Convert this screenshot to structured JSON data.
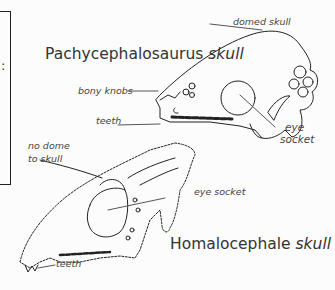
{
  "diagram": {
    "skulls": [
      {
        "id": "pachycephalosaurus",
        "genus": "Pachycephalosaurus",
        "suffix": "skull",
        "labels": {
          "domed_skull": "domed skull",
          "bony_knobs": "bony knobs",
          "teeth": "teeth",
          "eye_socket_line1": "eye",
          "eye_socket_line2": "socket"
        }
      },
      {
        "id": "homalocephale",
        "genus": "Homalocephale",
        "suffix": "skull",
        "labels": {
          "no_dome_line1": "no dome",
          "no_dome_line2": "to skull",
          "eye_socket": "eye socket",
          "teeth": "teeth"
        }
      }
    ],
    "side_box_fragment": ":"
  },
  "colors": {
    "background": "#fcfcfc",
    "line": "#222222",
    "text": "#333333"
  }
}
